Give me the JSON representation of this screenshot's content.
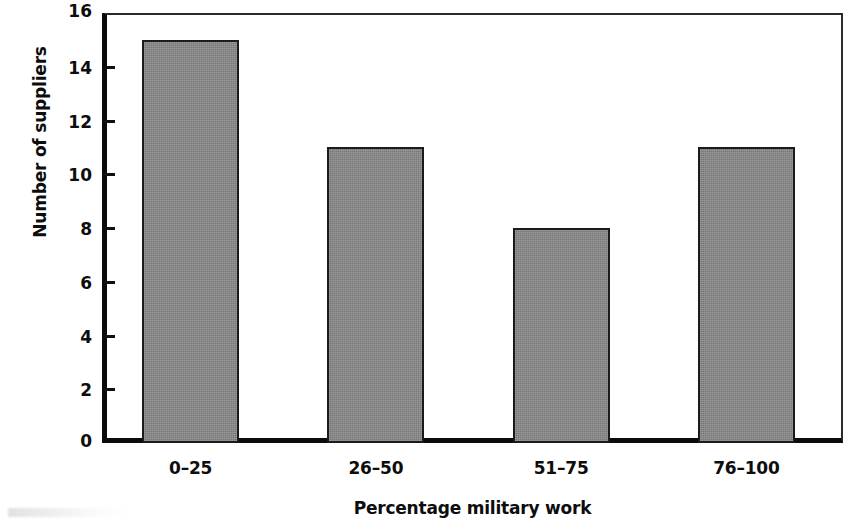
{
  "chart_data": {
    "type": "bar",
    "title": "",
    "subtitle": "",
    "xlabel": "Percentage military work",
    "ylabel": "Number of suppliers",
    "categories": [
      "0–25",
      "26–50",
      "51–75",
      "76–100"
    ],
    "values": [
      15,
      11,
      8,
      11
    ],
    "series": [
      {
        "name": "Number of suppliers",
        "values": [
          15,
          11,
          8,
          11
        ]
      }
    ],
    "ylim": [
      0,
      16
    ],
    "xlim": [
      0,
      4
    ],
    "ytick_labels": [
      "0",
      "2",
      "4",
      "6",
      "8",
      "10",
      "12",
      "14",
      "16"
    ],
    "ytick_values": [
      0,
      2,
      4,
      6,
      8,
      10,
      12,
      14,
      16
    ],
    "ytick_interval": 2,
    "grid": false,
    "legend": false,
    "legend_position": "none",
    "bar_fill_color": "#878787",
    "bar_edge_color": "#1b1b1b",
    "axis_color": "#0b0b0b",
    "background_color": "#ffffff",
    "annotations": []
  },
  "axes": {
    "y_title": "Number of suppliers",
    "x_title": "Percentage military work",
    "y_ticks": [
      {
        "label": "16",
        "value": 16
      },
      {
        "label": "14",
        "value": 14
      },
      {
        "label": "12",
        "value": 12
      },
      {
        "label": "10",
        "value": 10
      },
      {
        "label": "8",
        "value": 8
      },
      {
        "label": "6",
        "value": 6
      },
      {
        "label": "4",
        "value": 4
      },
      {
        "label": "2",
        "value": 2
      },
      {
        "label": "0",
        "value": 0
      }
    ],
    "x_ticks": [
      {
        "label": "0–25"
      },
      {
        "label": "26–50"
      },
      {
        "label": "51–75"
      },
      {
        "label": "76–100"
      }
    ]
  },
  "bars": [
    {
      "category": "0–25",
      "value": 15
    },
    {
      "category": "26–50",
      "value": 11
    },
    {
      "category": "51–75",
      "value": 8
    },
    {
      "category": "76–100",
      "value": 11
    }
  ]
}
